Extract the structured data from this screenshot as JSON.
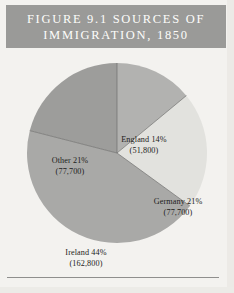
{
  "figure": {
    "title_line1": "FIGURE 9.1 SOURCES OF",
    "title_line2": "IMMIGRATION, 1850",
    "title_bar_color": "#9a9a98",
    "title_text_color": "#fdfdfb",
    "page_background": "#f3f2ef",
    "rule_color": "#8f8f8d"
  },
  "chart_data": {
    "type": "pie",
    "title": "FIGURE 9.1 SOURCES OF IMMIGRATION, 1850",
    "xlabel": "",
    "ylabel": "",
    "legend": "none",
    "grid": false,
    "total": 370000,
    "categories": [
      "England",
      "Germany",
      "Ireland",
      "Other"
    ],
    "values": [
      14,
      21,
      44,
      21
    ],
    "counts": [
      51800,
      77700,
      162800,
      77700
    ],
    "slices": [
      {
        "name": "England",
        "percent": 14,
        "count": 51800,
        "label_name": "England 14%",
        "label_value": "(51,800)",
        "color": "#b2b2b0",
        "start_angle": 0,
        "end_angle": 50.4
      },
      {
        "name": "Germany",
        "percent": 21,
        "count": 77700,
        "label_name": "Germany 21%",
        "label_value": "(77,700)",
        "color": "#e2e2de",
        "start_angle": 50.4,
        "end_angle": 126
      },
      {
        "name": "Ireland",
        "percent": 44,
        "count": 162800,
        "label_name": "Ireland 44%",
        "label_value": "(162,800)",
        "color": "#a9a9a7",
        "start_angle": 126,
        "end_angle": 284.4
      },
      {
        "name": "Other",
        "percent": 21,
        "count": 77700,
        "label_name": "Other 21%",
        "label_value": "(77,700)",
        "color": "#9d9d9b",
        "start_angle": 284.4,
        "end_angle": 360
      }
    ]
  }
}
